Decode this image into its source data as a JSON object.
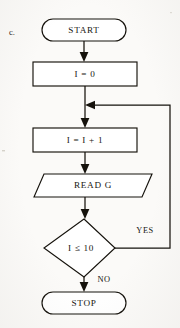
{
  "diagram": {
    "type": "flowchart",
    "item_label": "c.",
    "nodes": [
      {
        "id": "start",
        "shape": "terminator",
        "text": "START"
      },
      {
        "id": "init",
        "shape": "process",
        "text": "I = 0"
      },
      {
        "id": "increment",
        "shape": "process",
        "text": "I = I + 1"
      },
      {
        "id": "read",
        "shape": "input-output",
        "text": "READ G"
      },
      {
        "id": "decision",
        "shape": "decision",
        "text": "I ≤ 10"
      },
      {
        "id": "stop",
        "shape": "terminator",
        "text": "STOP"
      }
    ],
    "edges": [
      {
        "from": "start",
        "to": "init",
        "label": ""
      },
      {
        "from": "init",
        "to": "increment",
        "label": ""
      },
      {
        "from": "increment",
        "to": "read",
        "label": ""
      },
      {
        "from": "read",
        "to": "decision",
        "label": ""
      },
      {
        "from": "decision",
        "to": "increment",
        "label": "YES"
      },
      {
        "from": "decision",
        "to": "stop",
        "label": "NO"
      }
    ],
    "branch_labels": {
      "yes": "YES",
      "no": "NO"
    },
    "colors": {
      "stroke": "#15120c",
      "fill": "#ffffff",
      "paper": "#fbfaf8",
      "text": "#17150f"
    }
  }
}
